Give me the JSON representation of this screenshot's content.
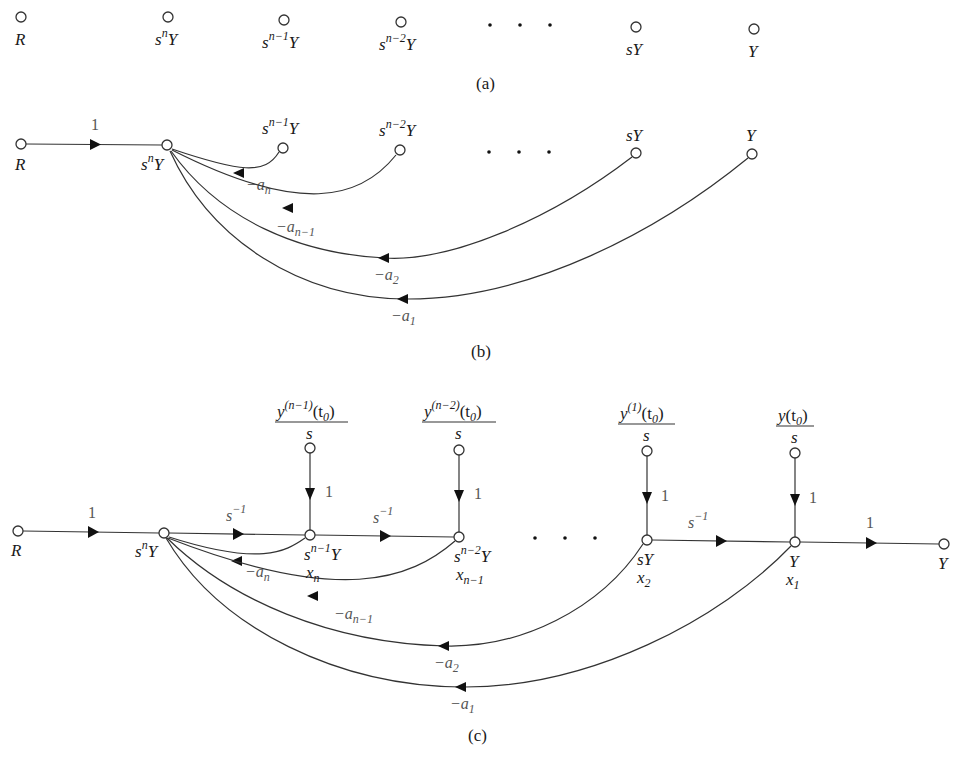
{
  "figure": {
    "panels": [
      {
        "id": "a",
        "caption": "(a)"
      },
      {
        "id": "b",
        "caption": "(b)"
      },
      {
        "id": "c",
        "caption": "(c)"
      }
    ]
  },
  "panel_a": {
    "caption": "(a)",
    "nodes": {
      "R": {
        "base": "R",
        "sup": ""
      },
      "snY": {
        "base": "s",
        "sup": "n",
        "tail": "Y"
      },
      "sn1Y": {
        "base": "s",
        "sup": "n−1",
        "tail": "Y"
      },
      "sn2Y": {
        "base": "s",
        "sup": "n−2",
        "tail": "Y"
      },
      "sY": {
        "base": "sY"
      },
      "Y": {
        "base": "Y"
      }
    },
    "ellipsis": "· · ·"
  },
  "panel_b": {
    "caption": "(b)",
    "forward_gain": "1",
    "nodes": {
      "R": "R",
      "snY": {
        "base": "s",
        "sup": "n",
        "tail": "Y"
      },
      "sn1Y": {
        "base": "s",
        "sup": "n−1",
        "tail": "Y"
      },
      "sn2Y": {
        "base": "s",
        "sup": "n−2",
        "tail": "Y"
      },
      "sY": "sY",
      "Y": "Y"
    },
    "feedback_gains": {
      "an": {
        "prefix": "−a",
        "sub": "n"
      },
      "an1": {
        "prefix": "−a",
        "sub": "n−1"
      },
      "a2": {
        "prefix": "−a",
        "sub": "2"
      },
      "a1": {
        "prefix": "−a",
        "sub": "1"
      }
    }
  },
  "panel_c": {
    "caption": "(c)",
    "input_gain": "1",
    "output_gain": "1",
    "integrator": {
      "base": "s",
      "sup": "−1"
    },
    "init_gain": "1",
    "initial_conditions": [
      {
        "num_base": "y",
        "num_sup": "(n−1)",
        "num_tail": "(t",
        "num_sub": "0",
        "num_close": ")",
        "den": "s"
      },
      {
        "num_base": "y",
        "num_sup": "(n−2)",
        "num_tail": "(t",
        "num_sub": "0",
        "num_close": ")",
        "den": "s"
      },
      {
        "num_base": "y",
        "num_sup": "(1)",
        "num_tail": "(t",
        "num_sub": "0",
        "num_close": ")",
        "den": "s"
      },
      {
        "num_base": "y",
        "num_sup": "",
        "num_tail": "(t",
        "num_sub": "0",
        "num_close": ")",
        "den": "s"
      }
    ],
    "nodes": {
      "R": "R",
      "snY": {
        "base": "s",
        "sup": "n",
        "tail": "Y"
      },
      "sn1Y": {
        "base": "s",
        "sup": "n−1",
        "tail": "Y",
        "state": "x",
        "state_sub": "n"
      },
      "sn2Y": {
        "base": "s",
        "sup": "n−2",
        "tail": "Y",
        "state": "x",
        "state_sub": "n−1"
      },
      "sY": {
        "base": "sY",
        "state": "x",
        "state_sub": "2"
      },
      "Y": {
        "base": "Y",
        "state": "x",
        "state_sub": "1"
      },
      "Yout": "Y"
    },
    "feedback_gains": {
      "an": {
        "prefix": "−a",
        "sub": "n"
      },
      "an1": {
        "prefix": "−a",
        "sub": "n−1"
      },
      "a2": {
        "prefix": "−a",
        "sub": "2"
      },
      "a1": {
        "prefix": "−a",
        "sub": "1"
      }
    }
  }
}
